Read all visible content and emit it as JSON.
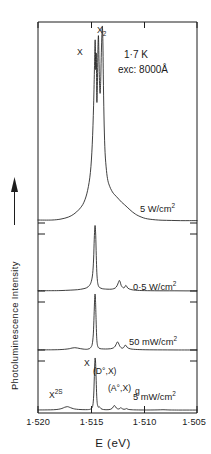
{
  "figure": {
    "title_visible": false,
    "arrow_icon": "up-arrow-icon"
  },
  "axes": {
    "x_label": "E  (eV)",
    "y_label": "Photoluminescence Intensity",
    "x_ticks": [
      "1·520",
      "1·515",
      "1·510",
      "1·505"
    ],
    "x_tick_values": [
      1.52,
      1.515,
      1.51,
      1.505
    ]
  },
  "conditions": {
    "temperature": "1·7 K",
    "excitation": "exc: 8000Å"
  },
  "traces": [
    {
      "power_label": "5 W/cm",
      "power_exp": "2"
    },
    {
      "power_label": "0·5 W/cm",
      "power_exp": "2"
    },
    {
      "power_label": "50 mW/cm",
      "power_exp": "2"
    },
    {
      "power_label": "5 mW/cm",
      "power_exp": "2"
    }
  ],
  "peak_labels": {
    "x_top": "X",
    "x2_top": "X",
    "x2_sub": "2",
    "x_bottom": "X",
    "d0x": "(D°,X)",
    "a0x": "(A°,X)",
    "g": "g",
    "x2s_base": "X",
    "x2s_sup": "2S"
  },
  "colors": {
    "ink": "#1d1d1d",
    "background": "#ffffff"
  },
  "chart_data": {
    "type": "line",
    "title": "",
    "xlabel": "E  (eV)",
    "ylabel": "Photoluminescence Intensity",
    "xlim": [
      1.5215,
      1.5042
    ],
    "x_reversed": true,
    "grid": false,
    "legend": "inline-right-labels",
    "annotations": [
      "1·7 K",
      "exc: 8000Å"
    ],
    "series": [
      {
        "name": "5 W/cm2",
        "points": [
          [
            1.5215,
            0.02
          ],
          [
            1.52,
            0.02
          ],
          [
            1.519,
            0.025
          ],
          [
            1.5182,
            0.035
          ],
          [
            1.5176,
            0.05
          ],
          [
            1.517,
            0.075
          ],
          [
            1.5165,
            0.11
          ],
          [
            1.5161,
            0.17
          ],
          [
            1.5158,
            0.26
          ],
          [
            1.5156,
            0.4
          ],
          [
            1.51545,
            0.6
          ],
          [
            1.51535,
            0.8
          ],
          [
            1.51528,
            0.93
          ],
          [
            1.51522,
            0.78
          ],
          [
            1.51516,
            0.86
          ],
          [
            1.5151,
            0.62
          ],
          [
            1.51504,
            0.7
          ],
          [
            1.51498,
            0.88
          ],
          [
            1.51492,
            0.95
          ],
          [
            1.51486,
            0.82
          ],
          [
            1.5148,
            0.7
          ],
          [
            1.51474,
            0.66
          ],
          [
            1.51468,
            0.72
          ],
          [
            1.51462,
            0.84
          ],
          [
            1.51456,
            0.94
          ],
          [
            1.5145,
            1.0
          ],
          [
            1.51444,
            0.92
          ],
          [
            1.51438,
            0.7
          ],
          [
            1.5143,
            0.5
          ],
          [
            1.5142,
            0.36
          ],
          [
            1.51405,
            0.27
          ],
          [
            1.5139,
            0.22
          ],
          [
            1.5137,
            0.19
          ],
          [
            1.5135,
            0.17
          ],
          [
            1.5133,
            0.155
          ],
          [
            1.513,
            0.14
          ],
          [
            1.5127,
            0.125
          ],
          [
            1.5124,
            0.11
          ],
          [
            1.5121,
            0.098
          ],
          [
            1.5118,
            0.085
          ],
          [
            1.5115,
            0.072
          ],
          [
            1.5112,
            0.06
          ],
          [
            1.5109,
            0.05
          ],
          [
            1.5106,
            0.042
          ],
          [
            1.5102,
            0.034
          ],
          [
            1.5098,
            0.028
          ],
          [
            1.5093,
            0.024
          ],
          [
            1.5087,
            0.021
          ],
          [
            1.508,
            0.019
          ],
          [
            1.507,
            0.018
          ],
          [
            1.506,
            0.017
          ],
          [
            1.505,
            0.017
          ],
          [
            1.5042,
            0.017
          ]
        ]
      },
      {
        "name": "0·5 W/cm2",
        "points": [
          [
            1.5215,
            0.02
          ],
          [
            1.52,
            0.02
          ],
          [
            1.519,
            0.022
          ],
          [
            1.518,
            0.028
          ],
          [
            1.5172,
            0.035
          ],
          [
            1.5166,
            0.048
          ],
          [
            1.5162,
            0.065
          ],
          [
            1.5159,
            0.1
          ],
          [
            1.5157,
            0.16
          ],
          [
            1.51555,
            0.28
          ],
          [
            1.51545,
            0.5
          ],
          [
            1.51538,
            0.8
          ],
          [
            1.51532,
            0.97
          ],
          [
            1.51528,
            1.0
          ],
          [
            1.51522,
            0.86
          ],
          [
            1.51516,
            0.55
          ],
          [
            1.5151,
            0.3
          ],
          [
            1.51504,
            0.18
          ],
          [
            1.51498,
            0.12
          ],
          [
            1.5149,
            0.085
          ],
          [
            1.5148,
            0.068
          ],
          [
            1.51465,
            0.057
          ],
          [
            1.5145,
            0.05
          ],
          [
            1.5143,
            0.046
          ],
          [
            1.514,
            0.043
          ],
          [
            1.5137,
            0.042
          ],
          [
            1.5134,
            0.045
          ],
          [
            1.5131,
            0.06
          ],
          [
            1.5129,
            0.095
          ],
          [
            1.51275,
            0.145
          ],
          [
            1.51265,
            0.175
          ],
          [
            1.51255,
            0.15
          ],
          [
            1.51245,
            0.1
          ],
          [
            1.5123,
            0.072
          ],
          [
            1.51215,
            0.062
          ],
          [
            1.51205,
            0.078
          ],
          [
            1.51195,
            0.1
          ],
          [
            1.51185,
            0.085
          ],
          [
            1.51175,
            0.062
          ],
          [
            1.5116,
            0.048
          ],
          [
            1.5114,
            0.038
          ],
          [
            1.5111,
            0.03
          ],
          [
            1.5107,
            0.025
          ],
          [
            1.5102,
            0.022
          ],
          [
            1.5096,
            0.02
          ],
          [
            1.5088,
            0.019
          ],
          [
            1.5078,
            0.018
          ],
          [
            1.5066,
            0.018
          ],
          [
            1.5054,
            0.017
          ],
          [
            1.5042,
            0.017
          ]
        ]
      },
      {
        "name": "50 mW/cm2",
        "points": [
          [
            1.5215,
            0.02
          ],
          [
            1.52,
            0.021
          ],
          [
            1.5192,
            0.024
          ],
          [
            1.5186,
            0.03
          ],
          [
            1.5181,
            0.04
          ],
          [
            1.5178,
            0.052
          ],
          [
            1.5175,
            0.058
          ],
          [
            1.5172,
            0.052
          ],
          [
            1.5169,
            0.042
          ],
          [
            1.5166,
            0.034
          ],
          [
            1.5163,
            0.03
          ],
          [
            1.5161,
            0.032
          ],
          [
            1.5159,
            0.042
          ],
          [
            1.51575,
            0.065
          ],
          [
            1.5156,
            0.12
          ],
          [
            1.51548,
            0.3
          ],
          [
            1.5154,
            0.62
          ],
          [
            1.51534,
            0.9
          ],
          [
            1.51529,
            1.0
          ],
          [
            1.51524,
            0.88
          ],
          [
            1.51518,
            0.55
          ],
          [
            1.51512,
            0.26
          ],
          [
            1.51506,
            0.13
          ],
          [
            1.51498,
            0.075
          ],
          [
            1.51488,
            0.052
          ],
          [
            1.51475,
            0.042
          ],
          [
            1.5146,
            0.038
          ],
          [
            1.5144,
            0.036
          ],
          [
            1.51415,
            0.035
          ],
          [
            1.5139,
            0.036
          ],
          [
            1.5136,
            0.04
          ],
          [
            1.5133,
            0.055
          ],
          [
            1.5131,
            0.085
          ],
          [
            1.51295,
            0.135
          ],
          [
            1.51285,
            0.16
          ],
          [
            1.51275,
            0.14
          ],
          [
            1.51262,
            0.092
          ],
          [
            1.51248,
            0.062
          ],
          [
            1.51235,
            0.05
          ],
          [
            1.51222,
            0.056
          ],
          [
            1.5121,
            0.08
          ],
          [
            1.512,
            0.105
          ],
          [
            1.5119,
            0.09
          ],
          [
            1.51178,
            0.062
          ],
          [
            1.51162,
            0.046
          ],
          [
            1.5114,
            0.036
          ],
          [
            1.5111,
            0.03
          ],
          [
            1.5107,
            0.026
          ],
          [
            1.5101,
            0.023
          ],
          [
            1.5094,
            0.021
          ],
          [
            1.5085,
            0.02
          ],
          [
            1.5074,
            0.019
          ],
          [
            1.5062,
            0.018
          ],
          [
            1.505,
            0.018
          ],
          [
            1.5042,
            0.018
          ]
        ]
      },
      {
        "name": "5 mW/cm2",
        "points": [
          [
            1.5215,
            0.02
          ],
          [
            1.5205,
            0.021
          ],
          [
            1.5198,
            0.024
          ],
          [
            1.5193,
            0.032
          ],
          [
            1.5189,
            0.048
          ],
          [
            1.5186,
            0.07
          ],
          [
            1.5183,
            0.082
          ],
          [
            1.5181,
            0.072
          ],
          [
            1.5178,
            0.052
          ],
          [
            1.5175,
            0.038
          ],
          [
            1.5171,
            0.03
          ],
          [
            1.5167,
            0.026
          ],
          [
            1.5163,
            0.025
          ],
          [
            1.516,
            0.027
          ],
          [
            1.5158,
            0.034
          ],
          [
            1.51565,
            0.055
          ],
          [
            1.51553,
            0.11
          ],
          [
            1.51544,
            0.3
          ],
          [
            1.51537,
            0.65
          ],
          [
            1.51532,
            0.92
          ],
          [
            1.51528,
            1.0
          ],
          [
            1.51523,
            0.9
          ],
          [
            1.51517,
            0.58
          ],
          [
            1.51511,
            0.28
          ],
          [
            1.51505,
            0.14
          ],
          [
            1.51497,
            0.085
          ],
          [
            1.5149,
            0.07
          ],
          [
            1.51483,
            0.082
          ],
          [
            1.51475,
            0.065
          ],
          [
            1.51465,
            0.045
          ],
          [
            1.51452,
            0.034
          ],
          [
            1.51438,
            0.028
          ],
          [
            1.5142,
            0.025
          ],
          [
            1.514,
            0.024
          ],
          [
            1.51378,
            0.026
          ],
          [
            1.51358,
            0.034
          ],
          [
            1.51342,
            0.052
          ],
          [
            1.5133,
            0.082
          ],
          [
            1.5132,
            0.105
          ],
          [
            1.5131,
            0.088
          ],
          [
            1.51298,
            0.058
          ],
          [
            1.51285,
            0.042
          ],
          [
            1.51272,
            0.038
          ],
          [
            1.5126,
            0.048
          ],
          [
            1.5125,
            0.062
          ],
          [
            1.5124,
            0.052
          ],
          [
            1.51228,
            0.038
          ],
          [
            1.51214,
            0.032
          ],
          [
            1.512,
            0.036
          ],
          [
            1.5119,
            0.046
          ],
          [
            1.5118,
            0.04
          ],
          [
            1.51168,
            0.031
          ],
          [
            1.5115,
            0.026
          ],
          [
            1.51125,
            0.023
          ],
          [
            1.51095,
            0.021
          ],
          [
            1.51055,
            0.02
          ],
          [
            1.51,
            0.019
          ],
          [
            1.5093,
            0.019
          ],
          [
            1.50845,
            0.021
          ],
          [
            1.5079,
            0.024
          ],
          [
            1.50745,
            0.021
          ],
          [
            1.507,
            0.019
          ],
          [
            1.5062,
            0.018
          ],
          [
            1.5053,
            0.018
          ],
          [
            1.5042,
            0.018
          ]
        ]
      }
    ]
  }
}
